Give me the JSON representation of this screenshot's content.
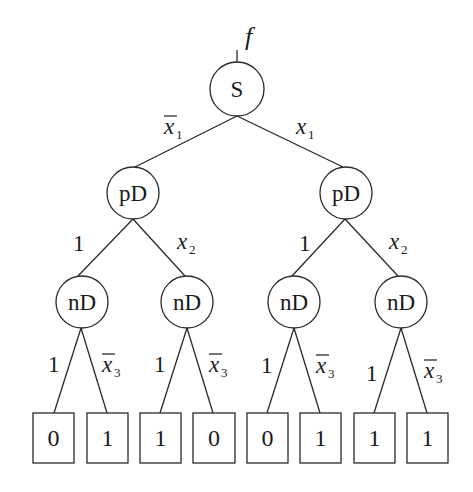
{
  "diagram": {
    "output_label": "f",
    "root": {
      "id": "s",
      "label": "S",
      "cx": 237,
      "cy": 89,
      "r": 27
    },
    "level1": [
      {
        "id": "pd-left",
        "label": "pD",
        "cx": 133,
        "cy": 193,
        "r": 26
      },
      {
        "id": "pd-right",
        "label": "pD",
        "cx": 346,
        "cy": 193,
        "r": 26
      }
    ],
    "level2": [
      {
        "id": "nd-1",
        "label": "nD",
        "cx": 82,
        "cy": 302,
        "r": 26
      },
      {
        "id": "nd-2",
        "label": "nD",
        "cx": 187,
        "cy": 302,
        "r": 26
      },
      {
        "id": "nd-3",
        "label": "nD",
        "cx": 294,
        "cy": 302,
        "r": 26
      },
      {
        "id": "nd-4",
        "label": "nD",
        "cx": 401,
        "cy": 302,
        "r": 26
      }
    ],
    "leaves": [
      {
        "label": "0",
        "x": 33,
        "w": 41
      },
      {
        "label": "1",
        "x": 87,
        "w": 41
      },
      {
        "label": "1",
        "x": 140,
        "w": 41
      },
      {
        "label": "0",
        "x": 193,
        "w": 42
      },
      {
        "label": "0",
        "x": 247,
        "w": 41
      },
      {
        "label": "1",
        "x": 300,
        "w": 41
      },
      {
        "label": "1",
        "x": 354,
        "w": 41
      },
      {
        "label": "1",
        "x": 407,
        "w": 41
      }
    ],
    "edge_labels": {
      "root_left": {
        "var": "x",
        "sub": "1",
        "negated": true
      },
      "root_right": {
        "var": "x",
        "sub": "1",
        "negated": false
      },
      "pd_left_left": "1",
      "pd_left_right": {
        "var": "x",
        "sub": "2",
        "negated": false
      },
      "pd_right_left": "1",
      "pd_right_right": {
        "var": "x",
        "sub": "2",
        "negated": false
      },
      "nd_left": "1",
      "nd_right": {
        "var": "x",
        "sub": "3",
        "negated": true
      }
    },
    "colors": {
      "stroke": "#2a2a2a",
      "text": "#1a1a1a",
      "background": "#ffffff"
    }
  }
}
